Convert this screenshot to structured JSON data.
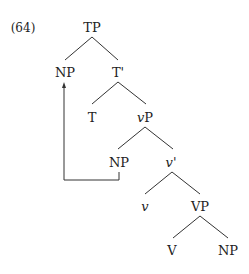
{
  "example_number": "(64)",
  "tree": {
    "nodes": [
      {
        "id": "tp",
        "label": "TP",
        "x": 92,
        "y": 28,
        "italic": false
      },
      {
        "id": "np-spec",
        "label": "NP",
        "x": 65,
        "y": 73,
        "italic": false
      },
      {
        "id": "t-bar",
        "label": "T'",
        "x": 118,
        "y": 73,
        "italic": false
      },
      {
        "id": "t",
        "label": "T",
        "x": 92,
        "y": 118,
        "italic": false
      },
      {
        "id": "vp-little",
        "label": "vP",
        "x": 145,
        "y": 118,
        "italic": false
      },
      {
        "id": "np-vspec",
        "label": "NP",
        "x": 119,
        "y": 163,
        "italic": false
      },
      {
        "id": "v-bar",
        "label": "v'",
        "x": 171,
        "y": 163,
        "italic": false
      },
      {
        "id": "v-little",
        "label": "v",
        "x": 145,
        "y": 207,
        "italic": true
      },
      {
        "id": "vp",
        "label": "VP",
        "x": 200,
        "y": 207,
        "italic": false
      },
      {
        "id": "v",
        "label": "V",
        "x": 172,
        "y": 251,
        "italic": false
      },
      {
        "id": "np-obj",
        "label": "NP",
        "x": 228,
        "y": 251,
        "italic": false
      }
    ],
    "movement": {
      "from": "NP (spec,vP)",
      "to": "NP (spec,TP)"
    }
  },
  "labels": {
    "tp": "TP",
    "np_spec": "NP",
    "t_bar": "T'",
    "t": "T",
    "vp_v": "P",
    "vp_v_italic": "v",
    "np_vspec": "NP",
    "vbar_v": "v",
    "vbar_prime": "'",
    "v_little": "v",
    "vp": "VP",
    "v": "V",
    "np_obj": "NP"
  }
}
